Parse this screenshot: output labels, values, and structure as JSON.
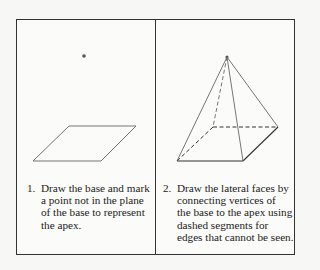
{
  "panels": [
    {
      "number": "1.",
      "caption_lines": [
        "Draw the base and mark",
        "a point not in the plane",
        "of the base to represent",
        "the apex."
      ],
      "figure": "parallelogram base with apex point"
    },
    {
      "number": "2.",
      "caption_lines": [
        "Draw the lateral faces by",
        "connecting vertices of",
        "the base to the apex using",
        "dashed segments for",
        "edges that cannot be seen."
      ],
      "figure": "square pyramid with hidden edges dashed"
    }
  ],
  "colors": {
    "line": "#555555",
    "frame": "#333333",
    "point": "#555555"
  }
}
